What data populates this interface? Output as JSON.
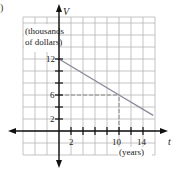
{
  "figure": {
    "corner_label": ")"
  },
  "chart_data": {
    "type": "line",
    "title": "",
    "xlabel": "t",
    "ylabel": "V",
    "x_unit_label": "(years)",
    "y_unit_label_line1": "(thousands",
    "y_unit_label_line2": "of dollars)",
    "x_ticks": [
      2,
      10,
      14
    ],
    "x_tick_labels": [
      "2",
      "10",
      "14"
    ],
    "y_ticks": [
      2,
      6,
      12
    ],
    "y_tick_labels": [
      "2",
      "6",
      "12"
    ],
    "xlim": [
      -8,
      16
    ],
    "ylim": [
      -4,
      19
    ],
    "grid": true,
    "series": [
      {
        "name": "V(t)",
        "x": [
          0,
          10,
          15.7
        ],
        "y": [
          12,
          6,
          2.6
        ],
        "color": "#8a8a9a"
      }
    ],
    "annotations": [
      {
        "type": "dashed-guide",
        "from": [
          0,
          6
        ],
        "to": [
          10,
          6
        ]
      },
      {
        "type": "dashed-guide",
        "from": [
          10,
          0
        ],
        "to": [
          10,
          6
        ]
      }
    ]
  },
  "colors": {
    "axis": "#111111",
    "grid": "#b5b5b5",
    "line": "#8a8a9a",
    "guide": "#888888"
  }
}
